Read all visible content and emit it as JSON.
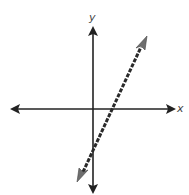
{
  "graph": {
    "x_axis_label": "x",
    "y_axis_label": "y",
    "colors": {
      "axis": "#222222",
      "line": "#2a2a2a",
      "line_arrowhead": "#6e6e6e",
      "background": "#ffffff"
    },
    "line": {
      "style": "dashed",
      "slope_sign": "positive",
      "x_intercept_sign": "positive",
      "y_intercept_sign": "negative"
    }
  }
}
